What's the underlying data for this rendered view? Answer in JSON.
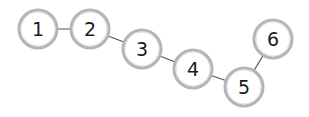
{
  "diagram": {
    "type": "chain-graph",
    "nodes": [
      {
        "id": "1",
        "label": "1",
        "x": 38,
        "y": 29
      },
      {
        "id": "2",
        "label": "2",
        "x": 90,
        "y": 29
      },
      {
        "id": "3",
        "label": "3",
        "x": 142,
        "y": 49
      },
      {
        "id": "4",
        "label": "4",
        "x": 193,
        "y": 69
      },
      {
        "id": "5",
        "label": "5",
        "x": 244,
        "y": 87
      },
      {
        "id": "6",
        "label": "6",
        "x": 273,
        "y": 39
      }
    ],
    "edges": [
      {
        "from": "1",
        "to": "2"
      },
      {
        "from": "2",
        "to": "3"
      },
      {
        "from": "3",
        "to": "4"
      },
      {
        "from": "4",
        "to": "5"
      },
      {
        "from": "5",
        "to": "6"
      }
    ],
    "node_radius": 19,
    "colors": {
      "node_border": "#b5b5b5",
      "node_fill": "#ffffff",
      "edge": "#555555",
      "text": "#1a1a1a"
    }
  }
}
